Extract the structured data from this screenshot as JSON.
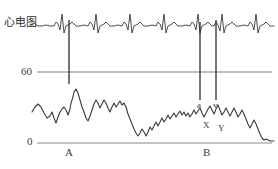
{
  "figure": {
    "ecg_label": "心电图",
    "axis": {
      "tick_high": "60",
      "tick_zero": "0"
    },
    "segments": {
      "a": "A",
      "b": "B"
    },
    "annotations": {
      "a_wave": "a",
      "v_wave": "v",
      "x_descent": "X",
      "y_descent": "Y"
    },
    "colors": {
      "trace": "#3a3a3a",
      "gridline": "#7a7a7a",
      "marker": "#2b2b2b",
      "background": "#ffffff"
    }
  },
  "chart_data": {
    "type": "line",
    "title": "",
    "xlabel": "",
    "ylabel": "",
    "ylim": [
      0,
      90
    ],
    "grid": true,
    "gridlines": [
      {
        "label": "60",
        "y_value": 60
      },
      {
        "label": "0",
        "y_value": 0
      }
    ],
    "legend": null,
    "annotations": [
      {
        "text": "a",
        "meaning": "a-wave",
        "x_px": 200,
        "y_px": 101
      },
      {
        "text": "v",
        "meaning": "v-wave",
        "x_px": 216,
        "y_px": 101
      },
      {
        "text": "X",
        "meaning": "x-descent",
        "x_px": 206,
        "y_px": 121
      },
      {
        "text": "Y",
        "meaning": "y-descent",
        "x_px": 221,
        "y_px": 124
      },
      {
        "text": "A",
        "meaning": "segment-A",
        "x_px": 68,
        "y_px": 147
      },
      {
        "text": "B",
        "meaning": "segment-B",
        "x_px": 206,
        "y_px": 147
      }
    ],
    "marker_lines": [
      {
        "x_px": 69,
        "y_top_px": 20,
        "y_bottom_px": 84
      },
      {
        "x_px": 200,
        "y_top_px": 22,
        "y_bottom_px": 100
      },
      {
        "x_px": 216,
        "y_top_px": 20,
        "y_bottom_px": 100
      }
    ],
    "series": [
      {
        "name": "心电图",
        "type": "ecg",
        "baseline_y_px": 24,
        "points_px": "30,26 34,23 38,26 42,26 46,25 50,26 54,26 56,22 58,24 60,30 62,14 64,33 66,26 68,25 70,24 72,22 74,24 76,26 80,26 84,25 88,26 90,22 92,24 94,30 96,14 98,33 100,26 102,25 104,24 106,22 108,24 110,26 114,26 118,25 122,26 124,22 126,24 128,30 130,14 132,33 134,26 136,25 138,24 140,22 142,24 144,26 148,26 152,25 156,26 158,22 160,24 162,30 164,14 166,33 168,26 170,25 172,24 174,22 176,24 178,26 182,26 186,25 190,26 192,22 194,24 196,30 198,14 200,33 202,26 204,25 206,24 208,22 210,24 212,26 214,26 216,22 218,25 220,31 222,14 224,33 226,26 228,25 230,24 232,22 234,24 236,26 240,26 244,25 248,26 250,22 252,24 254,30 256,14 258,33 260,26 262,25 264,24 266,22 268,24 270,26 274,26"
      },
      {
        "name": "静脉压力波形",
        "type": "pressure",
        "points_px": "32,112 35,107 38,104 41,107 44,113 47,118 50,116 52,112 54,118 56,123 58,117 60,112 62,109 64,107 66,110 68,115 70,109 71,103 73,97 74,92 76,89 78,93 80,100 82,107 84,112 86,118 88,121 90,116 92,110 94,104 96,100 98,103 100,108 102,104 104,100 106,103 108,108 110,112 112,107 114,103 116,107 118,104 120,101 122,105 124,103 126,107 128,114 130,119 132,124 134,129 136,133 138,136 140,133 142,129 144,132 146,136 148,132 150,127 152,130 154,126 156,122 158,126 160,122 162,118 164,122 166,119 168,115 170,119 172,116 174,113 176,117 178,114 180,111 182,115 184,112 186,116 188,113 190,117 192,114 194,110 196,114 198,111 200,108 202,113 204,117 206,113 208,109 210,106 212,110 214,114 216,109 218,105 220,110 222,115 224,112 226,108 228,112 230,116 232,112 234,108 236,112 238,117 240,114 242,110 244,114 246,119 248,124 250,128 252,124 254,120 256,124 258,129 260,134 262,138 264,140 266,139 268,140 270,141 274,141"
      }
    ]
  }
}
